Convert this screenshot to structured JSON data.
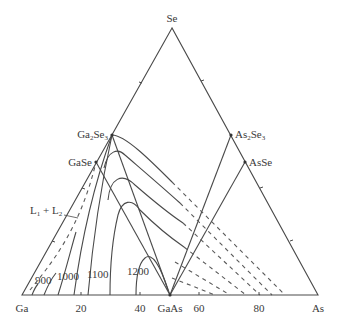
{
  "diagram": {
    "type": "ternary phase diagram",
    "vertices": {
      "top": "Se",
      "left": "Ga",
      "right": "As"
    },
    "compounds": {
      "ga2se3": {
        "base": "Ga",
        "sub1": "2",
        "mid": "Se",
        "sub2": "3"
      },
      "gase": "GaSe",
      "as2se3": {
        "base": "As",
        "sub1": "2",
        "mid": "Se",
        "sub2": "3"
      },
      "asse": "AsSe",
      "gaas": "GaAs"
    },
    "region_label": {
      "l1": "L",
      "sub1": "1",
      "plus": " + ",
      "l2": "L",
      "sub2": "2"
    },
    "isotherm_labels": [
      "900",
      "1000",
      "1100",
      "1200"
    ],
    "axis_ticks": [
      "20",
      "40",
      "60",
      "80"
    ],
    "colors": {
      "line": "#4a4a4a",
      "background": "#ffffff",
      "text": "#3a3a3a"
    }
  }
}
